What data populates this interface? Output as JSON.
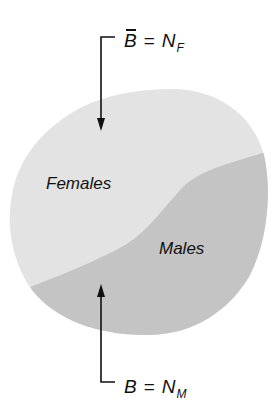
{
  "diagram": {
    "regions": [
      {
        "name": "females",
        "label": "Females",
        "fill": "#e3e3e3"
      },
      {
        "name": "males",
        "label": "Males",
        "fill": "#c4c4c4"
      }
    ],
    "annotations": {
      "top": {
        "symbol": "B",
        "symbol_overbar": true,
        "operator": "=",
        "rhs": "N",
        "rhs_subscript": "F",
        "points_to": "Females"
      },
      "bottom": {
        "symbol": "B",
        "symbol_overbar": false,
        "operator": "=",
        "rhs": "N",
        "rhs_subscript": "M",
        "points_to": "Males"
      }
    },
    "colors": {
      "background": "#ffffff",
      "females_fill": "#e3e3e3",
      "males_fill": "#c4c4c4",
      "ink": "#111111"
    }
  }
}
